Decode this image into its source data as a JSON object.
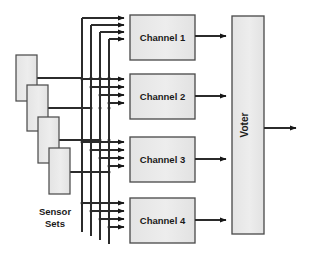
{
  "diagram": {
    "caption": {
      "line1": "Sensor",
      "line2": "Sets"
    },
    "colors": {
      "box_fill": "#e8e8e8",
      "box_stroke": "#4d4d4d",
      "line": "#2b2b2b",
      "background": "#ffffff",
      "text": "#1a1a1a"
    },
    "sensors": [
      {
        "id": "sensor-1",
        "label": "",
        "x": 16,
        "y": 55,
        "w": 21,
        "h": 46
      },
      {
        "id": "sensor-2",
        "label": "",
        "x": 27,
        "y": 85,
        "w": 21,
        "h": 46
      },
      {
        "id": "sensor-3",
        "label": "",
        "x": 38,
        "y": 117,
        "w": 21,
        "h": 46
      },
      {
        "id": "sensor-4",
        "label": "",
        "x": 49,
        "y": 148,
        "w": 21,
        "h": 46
      }
    ],
    "channels": [
      {
        "id": "channel-1",
        "label": "Channel 1",
        "x": 130,
        "y": 15,
        "w": 65,
        "h": 45
      },
      {
        "id": "channel-2",
        "label": "Channel 2",
        "x": 130,
        "y": 74,
        "w": 65,
        "h": 45
      },
      {
        "id": "channel-3",
        "label": "Channel 3",
        "x": 130,
        "y": 137,
        "w": 65,
        "h": 45
      },
      {
        "id": "channel-4",
        "label": "Channel 4",
        "x": 130,
        "y": 198,
        "w": 65,
        "h": 45
      }
    ],
    "voter": {
      "id": "voter",
      "label": "Voter",
      "x": 232,
      "y": 16,
      "w": 32,
      "h": 218
    },
    "bus_lines_x": [
      82,
      91,
      100,
      109
    ],
    "channel_output_y": [
      36,
      96,
      159,
      220
    ],
    "voter_output": {
      "y": 128,
      "x_end": 302
    }
  }
}
